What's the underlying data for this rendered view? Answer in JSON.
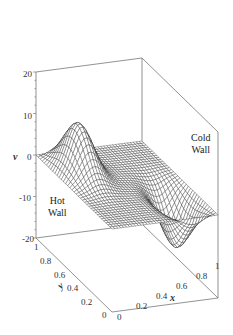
{
  "chart_data": {
    "type": "surface",
    "title": "",
    "xlabel": "x",
    "ylabel": "y",
    "zlabel": "v",
    "xlim": [
      0,
      1
    ],
    "ylim": [
      0,
      1
    ],
    "zlim": [
      -20,
      20
    ],
    "x_ticks": [
      "0",
      "0.2",
      "0.4",
      "0.6",
      "0.8",
      "1"
    ],
    "y_ticks": [
      "0",
      "0.2",
      "0.4",
      "0.6",
      "0.8",
      "1"
    ],
    "z_ticks": [
      "20",
      "10",
      "0",
      "-10",
      "-20"
    ],
    "annotations": [
      {
        "text": [
          "Hot",
          "Wall"
        ],
        "position": "left"
      },
      {
        "text": [
          "Cold",
          "Wall"
        ],
        "position": "right"
      }
    ],
    "surface_description": "Wireframe mesh; v=0 on boundaries; positive peak (~+12) near hot wall at high y, negative trough (~-12) near cold wall at low y",
    "peak": {
      "x": 0.2,
      "y": 0.75,
      "v": 12
    },
    "trough": {
      "x": 0.8,
      "y": 0.25,
      "v": -12
    },
    "grid": false,
    "box": true
  },
  "labels": {
    "z_axis": "v",
    "x_axis": "x",
    "y_axis": "y",
    "hot_wall_1": "Hot",
    "hot_wall_2": "Wall",
    "cold_wall_1": "Cold",
    "cold_wall_2": "Wall",
    "z20": "20",
    "z10": "10",
    "z0": "0",
    "zm10": "-10",
    "zm20": "-20",
    "y1": "1",
    "y08": "0.8",
    "y06": "0.6",
    "y04": "0.4",
    "y02": "0.2",
    "y0": "0",
    "x0": "0",
    "x02": "0.2",
    "x04": "0.4",
    "x06": "0.6",
    "x08": "0.8",
    "x1": "1"
  }
}
